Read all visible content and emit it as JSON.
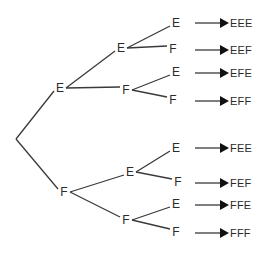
{
  "diagram": {
    "type": "probability-tree",
    "root": {
      "x": 16,
      "y": 139
    },
    "nodes": [
      {
        "id": "L1-E",
        "label": "E",
        "x": 60,
        "y": 88,
        "parent": "root"
      },
      {
        "id": "L1-F",
        "label": "F",
        "x": 64,
        "y": 192,
        "parent": "root"
      },
      {
        "id": "L2-EE",
        "label": "E",
        "x": 121,
        "y": 48,
        "parent": "L1-E"
      },
      {
        "id": "L2-EF",
        "label": "F",
        "x": 126,
        "y": 90,
        "parent": "L1-E"
      },
      {
        "id": "L2-FE",
        "label": "E",
        "x": 130,
        "y": 172,
        "parent": "L1-F"
      },
      {
        "id": "L2-FF",
        "label": "F",
        "x": 126,
        "y": 220,
        "parent": "L1-F"
      },
      {
        "id": "L3-EEE",
        "label": "E",
        "x": 176,
        "y": 23,
        "parent": "L2-EE"
      },
      {
        "id": "L3-EEF",
        "label": "F",
        "x": 173,
        "y": 49,
        "parent": "L2-EE"
      },
      {
        "id": "L3-EFE",
        "label": "E",
        "x": 176,
        "y": 72,
        "parent": "L2-EF"
      },
      {
        "id": "L3-EFF",
        "label": "F",
        "x": 173,
        "y": 100,
        "parent": "L2-EF"
      },
      {
        "id": "L3-FEE",
        "label": "E",
        "x": 176,
        "y": 148,
        "parent": "L2-FE"
      },
      {
        "id": "L3-FEF",
        "label": "F",
        "x": 178,
        "y": 182,
        "parent": "L2-FE"
      },
      {
        "id": "L3-FFE",
        "label": "E",
        "x": 176,
        "y": 204,
        "parent": "L2-FF"
      },
      {
        "id": "L3-FFF",
        "label": "F",
        "x": 176,
        "y": 232,
        "parent": "L2-FF"
      }
    ],
    "outcomes": [
      {
        "label": "EEE",
        "y": 23
      },
      {
        "label": "EEF",
        "y": 50
      },
      {
        "label": "EFE",
        "y": 73
      },
      {
        "label": "EFF",
        "y": 101
      },
      {
        "label": "FEE",
        "y": 148
      },
      {
        "label": "FEF",
        "y": 183
      },
      {
        "label": "FFE",
        "y": 205
      },
      {
        "label": "FFF",
        "y": 233
      }
    ],
    "colors": {
      "line": "#3a3a3a",
      "text": "#2a2a2a"
    }
  }
}
